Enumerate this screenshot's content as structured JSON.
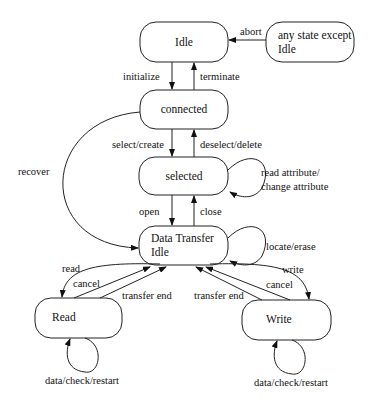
{
  "diagram": {
    "type": "state-machine",
    "states": [
      {
        "id": "idle",
        "label": "Idle"
      },
      {
        "id": "any",
        "label_lines": [
          "any state except",
          "Idle"
        ]
      },
      {
        "id": "connected",
        "label": "connected"
      },
      {
        "id": "selected",
        "label": "selected"
      },
      {
        "id": "dti",
        "label_lines": [
          "Data Transfer",
          "Idle"
        ]
      },
      {
        "id": "read",
        "label": "Read"
      },
      {
        "id": "write",
        "label": "Write"
      }
    ],
    "transitions": {
      "abort": "abort",
      "initialize": "initialize",
      "terminate": "terminate",
      "select_create": "select/create",
      "deselect_delete": "deselect/delete",
      "recover": "recover",
      "read_change_attr_lines": [
        "read attribute/",
        "change attribute"
      ],
      "open": "open",
      "close": "close",
      "locate_erase": "locate/erase",
      "read": "read",
      "cancel_read": "cancel",
      "transfer_end_read": "transfer end",
      "transfer_end_write": "transfer end",
      "cancel_write": "cancel",
      "write": "write",
      "read_loop": "data/check/restart",
      "write_loop": "data/check/restart"
    }
  }
}
